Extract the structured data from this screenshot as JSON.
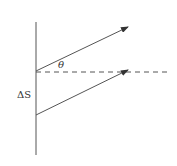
{
  "diagram": {
    "labels": {
      "angle": "θ",
      "separation": "ΔS"
    },
    "elements": {
      "wall": {
        "x": 36,
        "y1": 22,
        "y2": 155
      },
      "upper_ray": {
        "x1": 36,
        "y1": 71,
        "x2": 128,
        "y2": 27
      },
      "lower_ray": {
        "x1": 36,
        "y1": 115,
        "x2": 128,
        "y2": 70
      },
      "normal_dashed": {
        "x1": 36,
        "y1": 72,
        "x2": 167,
        "y2": 72
      }
    },
    "colors": {
      "stroke": "#555555",
      "background": "#ffffff"
    }
  }
}
